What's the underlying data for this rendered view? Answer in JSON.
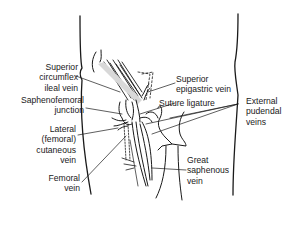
{
  "figure": {
    "colors": {
      "line": "#1a1a1a",
      "background": "#ffffff",
      "shade": "#bdbdbd"
    }
  },
  "labels": {
    "superior_circumflex_ileal_vein": {
      "lines": [
        "Superior",
        "circumflex",
        "ileal vein"
      ]
    },
    "saphenofemoral_junction": {
      "lines": [
        "Saphenofemoral",
        "junction"
      ]
    },
    "lateral_femoral_cutaneous_vein": {
      "lines": [
        "Lateral",
        "(femoral)",
        "cutaneous",
        "vein"
      ]
    },
    "femoral_vein": {
      "lines": [
        "Femoral",
        "vein"
      ]
    },
    "superior_epigastric_vein": {
      "lines": [
        "Superior",
        "epigastric vein"
      ]
    },
    "suture_ligature": {
      "lines": [
        "Suture ligature"
      ]
    },
    "external_pudendal_veins": {
      "lines": [
        "External",
        "pudendal",
        "veins"
      ]
    },
    "great_saphenous_vein": {
      "lines": [
        "Great",
        "saphenous",
        "vein"
      ]
    }
  }
}
